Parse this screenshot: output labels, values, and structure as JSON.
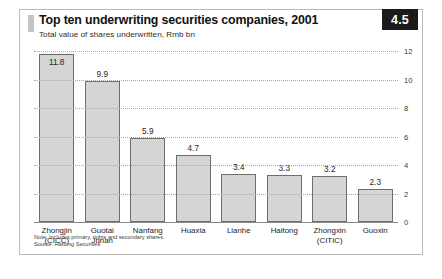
{
  "figure": {
    "badge": "4.5",
    "title": "Top ten underwriting securities companies, 2001",
    "subtitle": "Total value of shares underwritten, Rmb bn",
    "note": "Note: Includes primary, rights and secondary shares.",
    "source": "Source: Haitong Securities",
    "bar_fill": "#d5d5d5",
    "bar_stroke": "#6f6f6f",
    "badge_bg": "#1b1b1b"
  },
  "chart_data": {
    "type": "bar",
    "title": "Top ten underwriting securities companies, 2001",
    "subtitle": "Total value of shares underwritten, Rmb bn",
    "xlabel": "",
    "ylabel": "Rmb bn",
    "ylim": [
      0,
      12
    ],
    "yticks": [
      0,
      2,
      4,
      6,
      8,
      10,
      12
    ],
    "ytick_labels": [
      "0",
      "2",
      "4",
      "6",
      "8",
      "10",
      "12"
    ],
    "grid": true,
    "legend": false,
    "categories": [
      "Zhongjin (CICC)",
      "Guotai Junan",
      "Nanfang",
      "Huaxia",
      "Lianhe",
      "Haitong",
      "Zhongxin (CITIC)",
      "Guoxin"
    ],
    "category_lines": [
      [
        "Zhongjin",
        "(CICC)"
      ],
      [
        "Guotai",
        "Junan"
      ],
      [
        "Nanfang",
        ""
      ],
      [
        "Huaxia",
        ""
      ],
      [
        "Lianhe",
        ""
      ],
      [
        "Haitong",
        ""
      ],
      [
        "Zhongxin",
        "(CITIC)"
      ],
      [
        "Guoxin",
        ""
      ]
    ],
    "values": [
      11.8,
      9.9,
      5.9,
      4.7,
      3.4,
      3.3,
      3.2,
      2.3
    ],
    "value_labels": [
      "11.8",
      "9.9",
      "5.9",
      "4.7",
      "3.4",
      "3.3",
      "3.2",
      "2.3"
    ],
    "notes": [
      "Note: Includes primary, rights and secondary shares.",
      "Source: Haitong Securities"
    ]
  }
}
